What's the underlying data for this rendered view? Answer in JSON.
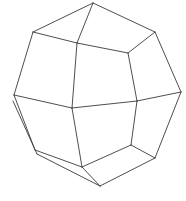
{
  "figure": {
    "name": "wireframe-dodecahedron",
    "title": "Wireframe polyhedron line drawing",
    "canvas": {
      "width": 186,
      "height": 201,
      "background_color": "#ffffff"
    },
    "style": {
      "stroke_color": "#3a3a3a",
      "stroke_width": 0.9,
      "fill": "none",
      "rendering": "antialiased-hand-drawn"
    },
    "vertices": {
      "top_apex": [
        93,
        3
      ],
      "upper_left": [
        33,
        32
      ],
      "upper_right": [
        155,
        32
      ],
      "inner_left": [
        77,
        43
      ],
      "inner_right": [
        128,
        53
      ],
      "left_upper": [
        14,
        95
      ],
      "left_mid": [
        13,
        101
      ],
      "right_mid": [
        181,
        92
      ],
      "mid_left": [
        72,
        108
      ],
      "mid_right": [
        137,
        101
      ],
      "lower_left_a": [
        35,
        150
      ],
      "lower_left_b": [
        37,
        154
      ],
      "lower_mid_left": [
        82,
        167
      ],
      "bottom_apex": [
        100,
        186
      ],
      "lower_right": [
        155,
        158
      ],
      "right_lower": [
        131,
        145
      ]
    },
    "edges": [
      {
        "name": "top-apex-to-upper-left",
        "from": "top_apex",
        "to": "upper_left"
      },
      {
        "name": "top-apex-to-upper-right",
        "from": "top_apex",
        "to": "upper_right"
      },
      {
        "name": "top-apex-to-inner-left",
        "from": "top_apex",
        "to": "inner_left"
      },
      {
        "name": "upper-left-to-inner-left",
        "from": "upper_left",
        "to": "inner_left"
      },
      {
        "name": "upper-left-to-left-upper",
        "from": "upper_left",
        "to": "left_upper"
      },
      {
        "name": "upper-right-to-inner-right",
        "from": "upper_right",
        "to": "inner_right"
      },
      {
        "name": "upper-right-to-right-mid",
        "from": "upper_right",
        "to": "right_mid"
      },
      {
        "name": "inner-left-to-inner-right",
        "from": "inner_left",
        "to": "inner_right"
      },
      {
        "name": "inner-left-to-mid-left",
        "from": "inner_left",
        "to": "mid_left"
      },
      {
        "name": "inner-right-to-mid-right",
        "from": "inner_right",
        "to": "mid_right"
      },
      {
        "name": "left-upper-to-mid-left",
        "from": "left_upper",
        "to": "mid_left"
      },
      {
        "name": "mid-left-to-mid-right",
        "from": "mid_left",
        "to": "mid_right"
      },
      {
        "name": "mid-right-to-right-mid",
        "from": "mid_right",
        "to": "right_mid"
      },
      {
        "name": "left-upper-to-lower-left-a",
        "from": "left_upper",
        "to": "lower_left_a"
      },
      {
        "name": "left-mid-to-lower-left-b",
        "from": "left_mid",
        "to": "lower_left_b"
      },
      {
        "name": "mid-left-to-lower-mid-left",
        "from": "mid_left",
        "to": "lower_mid_left"
      },
      {
        "name": "mid-right-to-right-lower",
        "from": "mid_right",
        "to": "right_lower"
      },
      {
        "name": "right-mid-to-lower-right",
        "from": "right_mid",
        "to": "lower_right"
      },
      {
        "name": "lower-left-a-to-lower-mid",
        "from": "lower_left_a",
        "to": "lower_mid_left"
      },
      {
        "name": "lower-left-b-to-bottom-apex",
        "from": "lower_left_b",
        "to": "bottom_apex"
      },
      {
        "name": "lower-mid-to-bottom-apex",
        "from": "lower_mid_left",
        "to": "bottom_apex"
      },
      {
        "name": "lower-mid-to-right-lower",
        "from": "lower_mid_left",
        "to": "right_lower"
      },
      {
        "name": "right-lower-to-lower-right",
        "from": "right_lower",
        "to": "lower_right"
      },
      {
        "name": "bottom-apex-to-lower-right",
        "from": "bottom_apex",
        "to": "lower_right"
      }
    ]
  }
}
